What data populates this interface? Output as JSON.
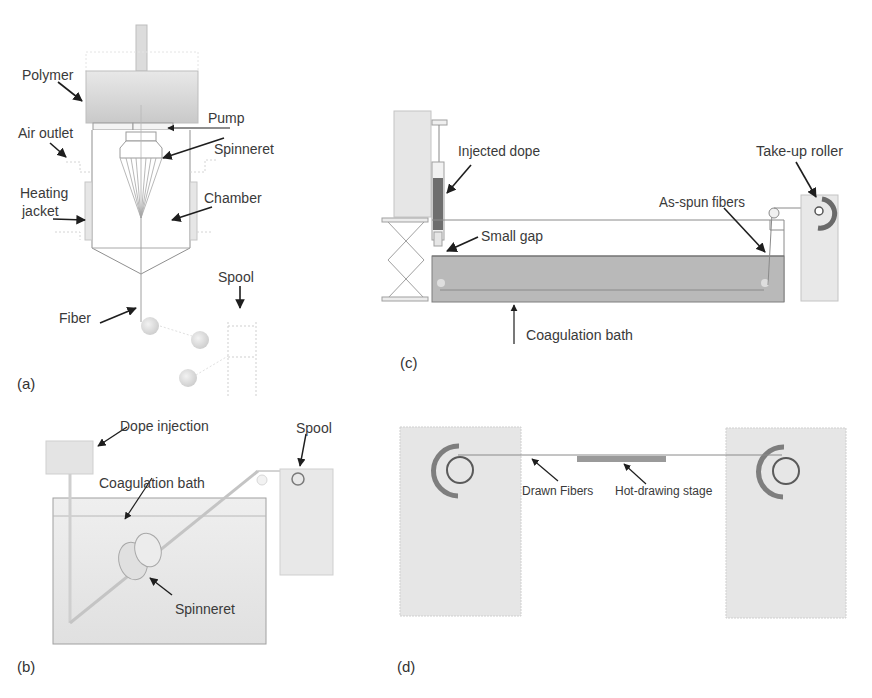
{
  "figure": {
    "panels": [
      {
        "id": "a",
        "tag": "(a)",
        "labels": {
          "polymer": "Polymer",
          "pump": "Pump",
          "air_outlet": "Air outlet",
          "spinneret": "Spinneret",
          "heating_jacket_line1": "Heating",
          "heating_jacket_line2": "jacket",
          "chamber": "Chamber",
          "spool": "Spool",
          "fiber": "Fiber"
        }
      },
      {
        "id": "b",
        "tag": "(b)",
        "labels": {
          "dope_injection": "Dope injection",
          "spool": "Spool",
          "coagulation_bath": "Coagulation bath",
          "spinneret": "Spinneret"
        }
      },
      {
        "id": "c",
        "tag": "(c)",
        "labels": {
          "injected_dope": "Injected dope",
          "take_up_roller": "Take-up roller",
          "as_spun_fibers": "As-spun fibers",
          "small_gap": "Small gap",
          "coagulation_bath": "Coagulation bath"
        }
      },
      {
        "id": "d",
        "tag": "(d)",
        "labels": {
          "drawn_fibers": "Drawn Fibers",
          "hot_drawing_stage": "Hot-drawing stage"
        }
      }
    ],
    "colors": {
      "fill_light": "#e4e4e4",
      "fill_mid": "#cfcfcf",
      "fill_dark": "#8f8f8f",
      "line": "#8a8a8a",
      "arrow": "#1e1e1e",
      "text": "#3a3a3a"
    }
  }
}
